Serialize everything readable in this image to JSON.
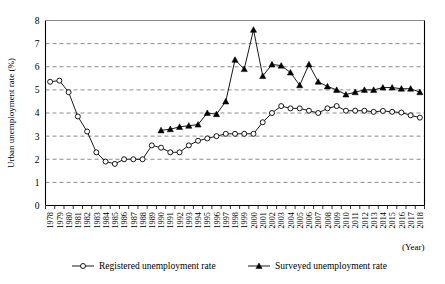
{
  "chart_data": {
    "type": "line",
    "title": "",
    "xlabel": "(Year)",
    "ylabel": "Urban unemployment rate (%)",
    "ylim": [
      0,
      8
    ],
    "yticks": [
      0,
      1,
      2,
      3,
      4,
      5,
      6,
      7,
      8
    ],
    "grid": true,
    "legend_position": "bottom",
    "x": [
      "1978",
      "1979",
      "1980",
      "1981",
      "1982",
      "1983",
      "1984",
      "1985",
      "1986",
      "1987",
      "1988",
      "1989",
      "1990",
      "1991",
      "1992",
      "1993",
      "1994",
      "1995",
      "1996",
      "1997",
      "1998",
      "1999",
      "2000",
      "2001",
      "2002",
      "2003",
      "2004",
      "2005",
      "2006",
      "2007",
      "2008",
      "2009",
      "2010",
      "2011",
      "2012",
      "2013",
      "2014",
      "2015",
      "2016",
      "2017",
      "2018"
    ],
    "categories": [
      "1978",
      "1979",
      "1980",
      "1981",
      "1982",
      "1983",
      "1984",
      "1985",
      "1986",
      "1987",
      "1988",
      "1989",
      "1990",
      "1991",
      "1992",
      "1993",
      "1994",
      "1995",
      "1996",
      "1997",
      "1998",
      "1999",
      "2000",
      "2001",
      "2002",
      "2003",
      "2004",
      "2005",
      "2006",
      "2007",
      "2008",
      "2009",
      "2010",
      "2011",
      "2012",
      "2013",
      "2014",
      "2015",
      "2016",
      "2017",
      "2018"
    ],
    "series": [
      {
        "name": "Registered unemployment rate",
        "marker": "open-circle",
        "values": [
          5.35,
          5.4,
          4.9,
          3.85,
          3.2,
          2.3,
          1.9,
          1.8,
          2.0,
          2.0,
          2.0,
          2.6,
          2.5,
          2.3,
          2.3,
          2.6,
          2.8,
          2.9,
          3.0,
          3.1,
          3.1,
          3.1,
          3.1,
          3.6,
          4.0,
          4.3,
          4.2,
          4.2,
          4.1,
          4.0,
          4.2,
          4.3,
          4.1,
          4.1,
          4.1,
          4.05,
          4.09,
          4.05,
          4.02,
          3.9,
          3.8
        ]
      },
      {
        "name": "Surveyed unemployment rate",
        "marker": "filled-triangle",
        "values": [
          null,
          null,
          null,
          null,
          null,
          null,
          null,
          null,
          null,
          null,
          null,
          null,
          3.25,
          3.3,
          3.4,
          3.45,
          3.5,
          4.0,
          3.95,
          4.5,
          6.3,
          5.9,
          7.6,
          5.6,
          6.1,
          6.05,
          5.75,
          5.2,
          6.1,
          5.35,
          5.15,
          5.0,
          4.8,
          4.9,
          5.0,
          5.0,
          5.1,
          5.1,
          5.05,
          5.05,
          4.9
        ]
      }
    ],
    "legend": [
      {
        "label": "Registered unemployment rate",
        "marker": "open-circle"
      },
      {
        "label": "Surveyed unemployment rate",
        "marker": "filled-triangle"
      }
    ],
    "colors": {
      "line": "#000000",
      "grid": "#6e6e6e",
      "background": "#ffffff"
    }
  }
}
